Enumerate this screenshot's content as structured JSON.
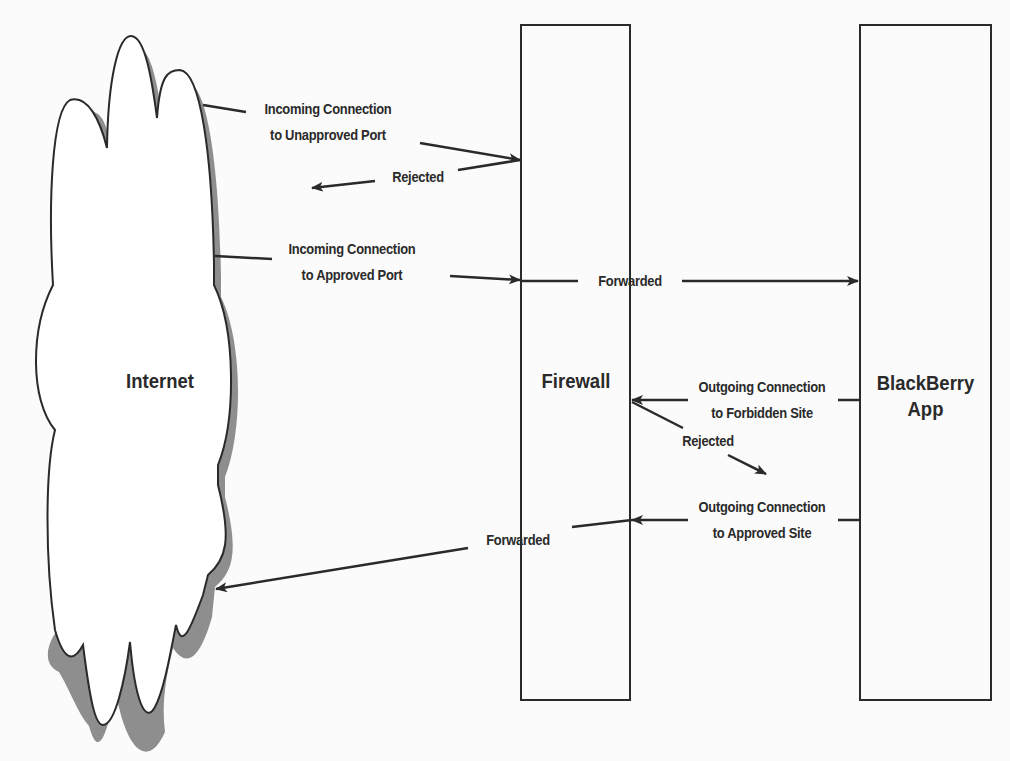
{
  "nodes": {
    "internet": {
      "label": "Internet"
    },
    "firewall": {
      "label": "Firewall"
    },
    "app": {
      "line1": "BlackBerry",
      "line2": "App"
    }
  },
  "connections": {
    "incoming_unapproved": {
      "line1": "Incoming Connection",
      "line2": "to Unapproved Port"
    },
    "incoming_unapproved_result": {
      "label": "Rejected"
    },
    "incoming_approved": {
      "line1": "Incoming Connection",
      "line2": "to Approved Port"
    },
    "incoming_approved_result": {
      "label": "Forwarded"
    },
    "outgoing_forbidden": {
      "line1": "Outgoing Connection",
      "line2": "to Forbidden Site"
    },
    "outgoing_forbidden_result": {
      "label": "Rejected"
    },
    "outgoing_approved": {
      "line1": "Outgoing Connection",
      "line2": "to Approved Site"
    },
    "outgoing_approved_result": {
      "label": "Forwarded"
    }
  },
  "colors": {
    "stroke": "#2a2a2a",
    "shadow": "#8e8e8e",
    "background": "#fbfbfb"
  }
}
